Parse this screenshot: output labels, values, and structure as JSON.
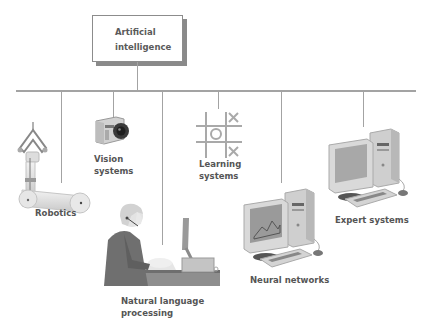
{
  "root": {
    "line1": "Artificial",
    "line2": "intelligence"
  },
  "branches": [
    {
      "id": "robotics",
      "label_lines": [
        "Robotics"
      ],
      "icon": "robot-arm-icon"
    },
    {
      "id": "vision",
      "label_lines": [
        "Vision",
        "systems"
      ],
      "icon": "camera-icon"
    },
    {
      "id": "nlp",
      "label_lines": [
        "Natural language",
        "processing"
      ],
      "icon": "person-at-computer-icon"
    },
    {
      "id": "learning",
      "label_lines": [
        "Learning",
        "systems"
      ],
      "icon": "tic-tac-toe-icon"
    },
    {
      "id": "neural",
      "label_lines": [
        "Neural networks"
      ],
      "icon": "desktop-computer-icon"
    },
    {
      "id": "expert",
      "label_lines": [
        "Expert systems"
      ],
      "icon": "desktop-computer-icon"
    }
  ],
  "colors": {
    "line": "#a3a3a3",
    "text": "#555555",
    "box_border": "#8c8c8c",
    "box_shadow": "#8a8a8a"
  }
}
